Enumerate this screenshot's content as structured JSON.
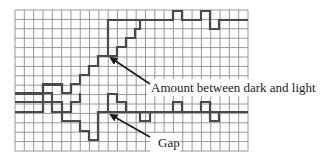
{
  "diagram": {
    "grid": {
      "x": 15,
      "y": 10,
      "cols": 25,
      "rows": 15,
      "cell_w": 9.32,
      "cell_h": 9.4,
      "line_color": "#8c8c8c"
    },
    "signal_color": "#4a4a4a",
    "top_signal": {
      "points": "15,93 43,93 43,84 52,84 52,93 71,93 71,84 80,84 80,75 89,75 89,66 98,66 98,56 108,56 108,20 135,20",
      "staircase": "108,56 117,56 117,47 126,47 126,38 135,38 135,29 140,29 140,20",
      "tail": "135,20 173,20 173,11 182,11 182,20 201,20 201,11 210,11 210,29 219,29 219,20 248,20"
    },
    "bottom_signal": {
      "points": "15,112 43,112 43,102 52,102 52,112 71,112 71,121 89,121 89,131 98,131 98,140 108,140 108,112 108,121",
      "rise": "108,112 108,102 117,102 117,112",
      "pulse": "108,112 108,102 117,102 117,112 126,112 126,121 135,121 135,131 140,131 140,112 248,112",
      "bumps": "135,112 173,112 173,102 182,102 182,112 201,112 201,102 210,102 210,121 219,121 219,112 248,112",
      "left": "15,102 43,102 43,93 52,93 52,102 62,102 62,112 71,112"
    },
    "annotations": [
      {
        "label": "Amount between dark and light",
        "text_x": 150,
        "text_y": 91,
        "arrow_from": [
          146,
          79
        ],
        "arrow_to": [
          110,
          58
        ]
      },
      {
        "label": "Gap",
        "text_x": 158,
        "text_y": 145,
        "arrow_from": [
          143,
          131
        ],
        "arrow_to": [
          110,
          115
        ]
      }
    ]
  }
}
